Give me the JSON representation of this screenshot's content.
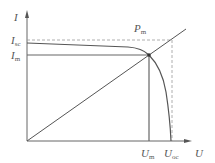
{
  "diagram": {
    "type": "I-U characteristic curve (photovoltaic cell)",
    "axes": {
      "y_label": "I",
      "x_label": "U"
    },
    "y_markers": [
      {
        "main": "I",
        "sub": "sc"
      },
      {
        "main": "I",
        "sub": "m"
      }
    ],
    "x_markers": [
      {
        "main": "U",
        "sub": "m"
      },
      {
        "main": "U",
        "sub": "oc"
      }
    ],
    "point_label": {
      "main": "P",
      "sub": "m"
    },
    "colors": {
      "line": "#555555",
      "dashed": "#999999",
      "background": "#ffffff"
    }
  }
}
